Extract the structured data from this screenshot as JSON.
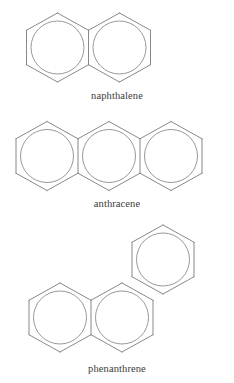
{
  "figure": {
    "background_color": "#ffffff",
    "stroke_color": "#7b7b7b",
    "stroke_width": 0.9,
    "ring_circle_color": "#8c8c8c",
    "caption_color": "#3b3b3b"
  },
  "structures": [
    {
      "name": "naphthalene",
      "label": "naphthalene",
      "ring_count": 2,
      "arrangement": "linear",
      "aromatic_circles": 2,
      "label_position": {
        "x": 100,
        "y": 90
      },
      "rings": [
        {
          "id": "naphthalene-ring-1",
          "cx": 57.5,
          "cy": 47.5,
          "circle": true
        },
        {
          "id": "naphthalene-ring-2",
          "cx": 119.5,
          "cy": 47.5,
          "circle": true
        }
      ]
    },
    {
      "name": "anthracene",
      "label": "anthracene",
      "ring_count": 3,
      "arrangement": "linear",
      "aromatic_circles": 3,
      "label_position": {
        "x": 104,
        "y": 198
      },
      "rings": [
        {
          "id": "anthracene-ring-1",
          "cx": 47.0,
          "cy": 156.0,
          "circle": true
        },
        {
          "id": "anthracene-ring-2",
          "cx": 109.0,
          "cy": 156.0,
          "circle": true
        },
        {
          "id": "anthracene-ring-3",
          "cx": 171.0,
          "cy": 156.0,
          "circle": true
        }
      ]
    },
    {
      "name": "phenanthrene",
      "label": "phenanthrene",
      "ring_count": 3,
      "arrangement": "angular",
      "aromatic_circles": 3,
      "label_position": {
        "x": 116,
        "y": 363
      },
      "rings": [
        {
          "id": "phenanthrene-ring-1",
          "cx": 60.0,
          "cy": 317.5,
          "circle": true
        },
        {
          "id": "phenanthrene-ring-2",
          "cx": 122.0,
          "cy": 317.5,
          "circle": true
        },
        {
          "id": "phenanthrene-ring-3",
          "cx": 163.0,
          "cy": 259.5,
          "circle": true
        }
      ]
    }
  ],
  "geometry": {
    "ring_width": 62,
    "ring_height": 69,
    "circle_radius": 26.5,
    "orientation": "pointy-top"
  }
}
